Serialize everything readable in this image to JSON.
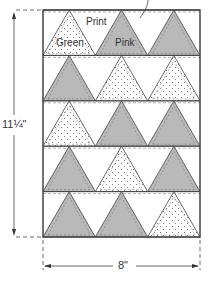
{
  "diagram": {
    "labels": {
      "green": "Green",
      "print": "Print",
      "pink": "Pink"
    },
    "dimensions": {
      "height": "11¼\"",
      "width": "8\""
    },
    "panel": {
      "x": 43,
      "y": 10,
      "w": 157,
      "h": 227,
      "rows": 5
    },
    "rows": [
      [
        "print-dots",
        "pink",
        "pink"
      ],
      [
        "pink",
        "dots",
        "dots"
      ],
      [
        "dots",
        "pink",
        "pink"
      ],
      [
        "pink",
        "dots",
        "pink"
      ],
      [
        "pink",
        "pink",
        "dots"
      ]
    ],
    "colors": {
      "pink": "#b9b9b9",
      "line": "#444444",
      "bg": "#ffffff"
    }
  }
}
